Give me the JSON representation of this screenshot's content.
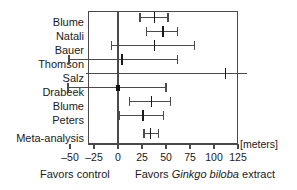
{
  "chart_data": {
    "type": "forest",
    "title": "",
    "xlabel": "[meters]",
    "ylabel": "",
    "units": "[meters]",
    "xlim": [
      -62,
      125
    ],
    "xticks": [
      -50,
      -25,
      0,
      25,
      50,
      75,
      100,
      125
    ],
    "xtick_labels": [
      "–50",
      "–25",
      "0",
      "25",
      "50",
      "75",
      "100",
      "125"
    ],
    "zero_reference": 0,
    "grid": false,
    "left_caption": "Favors control",
    "right_caption_prefix": "Favors ",
    "right_caption_italic": "Ginkgo biloba",
    "right_caption_suffix": " extract",
    "categories": [
      "Blume",
      "Natali",
      "Bauer",
      "Thomson",
      "Salz",
      "Drabeek",
      "Blume",
      "Peters",
      "Meta-analysis"
    ],
    "studies": [
      {
        "name": "Blume",
        "estimate": 38,
        "ci_low": 23,
        "ci_high": 52,
        "clipped_low": false,
        "clipped_high": false,
        "filled": false
      },
      {
        "name": "Natali",
        "estimate": 47,
        "ci_low": 30,
        "ci_high": 62,
        "clipped_low": false,
        "clipped_high": false,
        "filled": false
      },
      {
        "name": "Bauer",
        "estimate": 38,
        "ci_low": -7,
        "ci_high": 80,
        "clipped_low": false,
        "clipped_high": false,
        "filled": false
      },
      {
        "name": "Thomson",
        "estimate": 4,
        "ci_low": -51,
        "ci_high": 62,
        "clipped_low": false,
        "clipped_high": false,
        "filled": false
      },
      {
        "name": "Salz",
        "estimate": 112,
        "ci_low": -62,
        "ci_high": 125,
        "clipped_low": true,
        "clipped_high": true,
        "filled": false
      },
      {
        "name": "Drabeek",
        "estimate": 0,
        "ci_low": -52,
        "ci_high": 50,
        "clipped_low": false,
        "clipped_high": false,
        "filled": true
      },
      {
        "name": "Blume",
        "estimate": 35,
        "ci_low": 12,
        "ci_high": 55,
        "clipped_low": false,
        "clipped_high": false,
        "filled": false
      },
      {
        "name": "Peters",
        "estimate": 26,
        "ci_low": 1,
        "ci_high": 47,
        "clipped_low": false,
        "clipped_high": false,
        "filled": false
      },
      {
        "name": "Meta-analysis",
        "estimate": 34,
        "ci_low": 27,
        "ci_high": 42,
        "clipped_low": false,
        "clipped_high": false,
        "filled": false
      }
    ]
  },
  "colors": {
    "axis": "#4a4a4a",
    "marker": "#1a1a1a",
    "background": "#ffffff",
    "text": "#1a1a1a"
  }
}
